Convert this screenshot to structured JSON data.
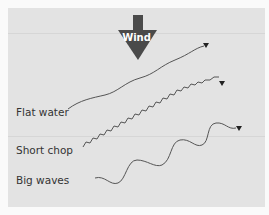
{
  "diagram": {
    "wind_label": "Wind",
    "wind_arrow_color": "#4a4a4a",
    "background_color": "#e3e3e3",
    "line_color": "#555555",
    "labels": [
      {
        "text": "Flat water",
        "line_style": "gentle-curve"
      },
      {
        "text": "Short chop",
        "line_style": "small-zigzag"
      },
      {
        "text": "Big waves",
        "line_style": "large-wave"
      }
    ]
  }
}
